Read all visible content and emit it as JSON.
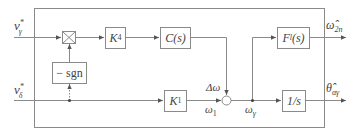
{
  "diagram": {
    "type": "control-block-diagram",
    "inputs": [
      {
        "id": "v_gamma_star",
        "symbol": "v",
        "sub": "γ",
        "sup": "*"
      },
      {
        "id": "v_delta_star",
        "symbol": "v",
        "sub": "δ",
        "sup": "*"
      }
    ],
    "blocks": {
      "multiplier": {
        "label": "×"
      },
      "sgn": {
        "label": "− sgn"
      },
      "k4": {
        "symbol": "K",
        "sub": "4"
      },
      "cs": {
        "label": "C(s)"
      },
      "k1": {
        "symbol": "K",
        "sub": "1"
      },
      "fl": {
        "symbol": "F",
        "sub": "l",
        "arg": "(s)"
      },
      "integrator": {
        "label": "1/s"
      }
    },
    "signals": {
      "delta_omega": "Δω",
      "omega1": {
        "symbol": "ω",
        "sub": "1"
      },
      "omega_gamma": {
        "symbol": "ω",
        "sub": "γ"
      }
    },
    "outputs": [
      {
        "id": "omega_hat_2n",
        "symbol": "ω̂",
        "sub": "2n"
      },
      {
        "id": "theta_hat_alpha_gamma",
        "symbol": "θ̂",
        "sub": "αγ"
      }
    ],
    "colors": {
      "line": "#8a8a8a",
      "text": "#444444",
      "background": "#ffffff"
    }
  }
}
